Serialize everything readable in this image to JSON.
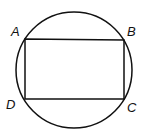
{
  "diagram": {
    "type": "inscribed-rectangle-in-circle",
    "circle": {
      "cx": 74,
      "cy": 71,
      "r": 58
    },
    "points": [
      {
        "label": "A",
        "x": 25,
        "y": 39,
        "lx": 11,
        "ly": 36
      },
      {
        "label": "B",
        "x": 124,
        "y": 40,
        "lx": 127,
        "ly": 36
      },
      {
        "label": "C",
        "x": 124,
        "y": 99,
        "lx": 127,
        "ly": 112
      },
      {
        "label": "D",
        "x": 25,
        "y": 99,
        "lx": 6,
        "ly": 109
      }
    ],
    "stroke_color": "#111111"
  }
}
